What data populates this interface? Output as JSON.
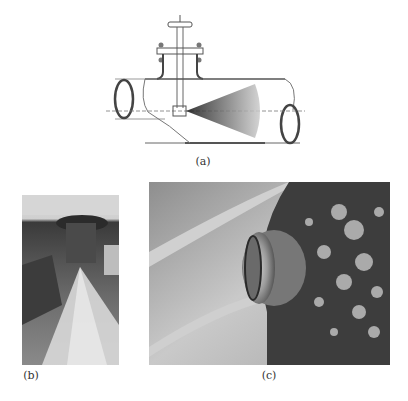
{
  "figure": {
    "panels": [
      {
        "id": "a",
        "label": "(a)",
        "kind": "line-drawing",
        "subject": "spray nozzle inserted into pipe with conical spray pattern"
      },
      {
        "id": "b",
        "label": "(b)",
        "kind": "photograph",
        "subject": "nozzle producing conical spray"
      },
      {
        "id": "c",
        "label": "(c)",
        "kind": "photograph",
        "subject": "nozzle head mounted on corroded pipe wall"
      }
    ]
  },
  "colors": {
    "background": "#ffffff",
    "line": "#555555",
    "spray_dark": "#222222",
    "spray_light": "#bbbbbb"
  }
}
